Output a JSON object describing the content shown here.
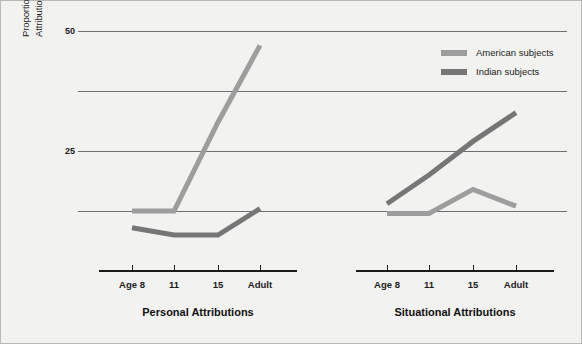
{
  "figure": {
    "background": "#f2f2f0",
    "axis_color": "#1b1b1b",
    "grid_color": "#6f6f71"
  },
  "yaxis": {
    "title_line1": "Proportion of Personal and Situational",
    "title_line2": "Attributions for Negative Behaviors",
    "tick_labels": [
      "50",
      "25"
    ],
    "tick_label_50": "50",
    "tick_label_25": "25"
  },
  "legend": {
    "position": "top-right",
    "items": [
      {
        "label": "American subjects",
        "color": "#9d9d9d"
      },
      {
        "label": "Indian subjects",
        "color": "#767676"
      }
    ]
  },
  "panels": [
    {
      "title": "Personal Attributions",
      "xticks": [
        "Age 8",
        "11",
        "15",
        "Adult"
      ]
    },
    {
      "title": "Situational Attributions",
      "xticks": [
        "Age 8",
        "11",
        "15",
        "Adult"
      ]
    }
  ],
  "chart_data": {
    "type": "line",
    "title": "",
    "xlabel": "",
    "ylabel": "Proportion of Personal and Situational Attributions for Negative Behaviors",
    "ylim": [
      0,
      50
    ],
    "yticks": [
      25,
      50
    ],
    "grid": true,
    "gridlines_y": [
      12.5,
      25,
      37.5,
      50
    ],
    "legend_position": "top-right",
    "panels": [
      {
        "name": "Personal Attributions",
        "categories": [
          "Age 8",
          "11",
          "15",
          "Adult"
        ],
        "series": [
          {
            "name": "American subjects",
            "color": "#9d9d9d",
            "values": [
              12.5,
              12.5,
              31,
              47
            ]
          },
          {
            "name": "Indian subjects",
            "color": "#767676",
            "values": [
              9,
              7.5,
              7.5,
              13
            ]
          }
        ]
      },
      {
        "name": "Situational Attributions",
        "categories": [
          "Age 8",
          "11",
          "15",
          "Adult"
        ],
        "series": [
          {
            "name": "American subjects",
            "color": "#9d9d9d",
            "values": [
              12,
              12,
              17,
              13.5
            ]
          },
          {
            "name": "Indian subjects",
            "color": "#767676",
            "values": [
              14,
              20,
              27,
              33
            ]
          }
        ]
      }
    ]
  }
}
